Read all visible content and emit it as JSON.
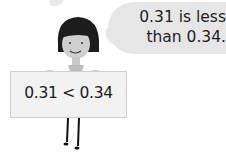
{
  "speech_bubble": {
    "line1": "0.31 is less",
    "line2": "than 0.34."
  },
  "sign": {
    "text": "0.31 < 0.34"
  },
  "colors": {
    "bubble": "#e6e6e6",
    "hair": "#1c1c1c",
    "skin": "#cfcfcf",
    "sign_bg": "#f2f2f2",
    "text": "#1e1e1e"
  }
}
